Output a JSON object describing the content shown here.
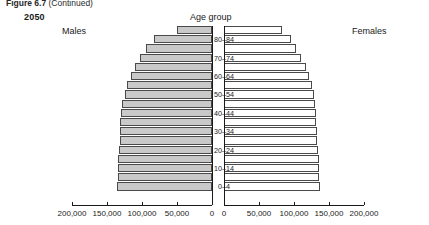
{
  "figure": {
    "caption_main": "Figure 6.7",
    "caption_note": "(Continued)"
  },
  "header": {
    "year": "2050",
    "males_label": "Males",
    "females_label": "Females",
    "age_group_label": "Age group"
  },
  "chart_data": {
    "type": "bar",
    "title": "2050",
    "subtype": "population-pyramid",
    "xlabel": "",
    "ylabel": "Age group",
    "grid": false,
    "legend_position": "inline-labels",
    "xlim_left": [
      200000,
      0
    ],
    "xlim_right": [
      0,
      200000
    ],
    "left_ticks": [
      "200,000",
      "150,000",
      "100,000",
      "50,000",
      "0"
    ],
    "left_tick_values": [
      200000,
      150000,
      100000,
      50000,
      0
    ],
    "right_ticks": [
      "0",
      "50,000",
      "100,000",
      "150,000",
      "200,000"
    ],
    "right_tick_values": [
      0,
      50000,
      100000,
      150000,
      200000
    ],
    "categories": [
      "0-4",
      "5-9",
      "10-14",
      "15-19",
      "20-24",
      "25-29",
      "30-34",
      "35-39",
      "40-44",
      "45-49",
      "50-54",
      "55-59",
      "60-64",
      "65-69",
      "70-74",
      "75-79",
      "80-84",
      "85+"
    ],
    "visible_category_labels": [
      "0–4",
      "10–14",
      "20–24",
      "30–34",
      "40–44",
      "50–54",
      "60–64",
      "70–74",
      "80–84"
    ],
    "series": [
      {
        "name": "Males",
        "color": "#c9c9c9",
        "values": [
          136000,
          134000,
          134000,
          135000,
          133000,
          132000,
          132000,
          131000,
          130000,
          128000,
          125000,
          121000,
          116000,
          110000,
          103000,
          95000,
          83000,
          50000
        ]
      },
      {
        "name": "Females",
        "color": "#ffffff",
        "values": [
          137000,
          135000,
          135000,
          136000,
          134000,
          133000,
          133000,
          132000,
          131000,
          130000,
          128000,
          125000,
          121000,
          117000,
          110000,
          103000,
          95000,
          83000
        ]
      }
    ]
  }
}
